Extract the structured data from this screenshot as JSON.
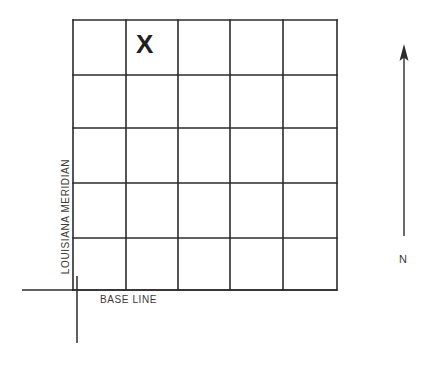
{
  "diagram": {
    "township_mark": "X",
    "baseline_label": "BASE LINE",
    "meridian_label": "LOUISIANA MERIDIAN",
    "north_label": "N",
    "line_color": "#2b2b2b",
    "text_color": "#3a3a3a",
    "background_color": "#ffffff",
    "grid": {
      "columns": 5,
      "rows": 5,
      "x_positions": [
        73,
        126,
        178,
        230,
        283,
        337
      ],
      "y_positions": [
        20,
        75,
        128,
        183,
        238,
        290
      ],
      "marked_cell": {
        "column": 2,
        "row": 1
      }
    },
    "axes": {
      "baseline_y": 290,
      "baseline_x_start": 22,
      "baseline_x_end": 337,
      "meridian_x": 77,
      "meridian_y_start": 276,
      "meridian_y_end": 343
    },
    "north_arrow": {
      "x": 404,
      "tip_y": 46,
      "tail_y": 236
    }
  }
}
